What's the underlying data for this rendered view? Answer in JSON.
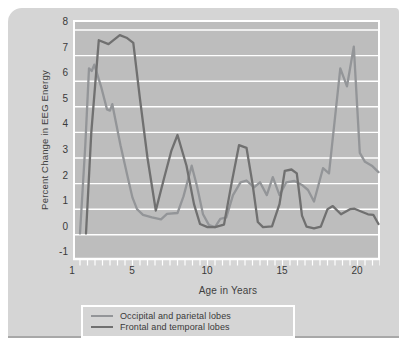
{
  "colors": {
    "page_bg": "#ffffff",
    "figure_bg": "#d5d5d5",
    "plot_bg": "#bdbdbd",
    "grid": "#ffffff",
    "text": "#3a3a3a",
    "series_occipital": "#939598",
    "series_frontal": "#707070"
  },
  "figure": {
    "y_axis_title": "Percent Change in EEG Energy",
    "x_axis_title": "Age in Years",
    "y_ticks": [
      "8",
      "7",
      "6",
      "5",
      "4",
      "3",
      "2",
      "1",
      "0",
      "-1"
    ],
    "x_ticks": [
      "1",
      "5",
      "10",
      "15",
      "20"
    ]
  },
  "legend": {
    "items": [
      {
        "label": "Occipital and parietal lobes"
      },
      {
        "label": "Frontal and temporal lobes"
      }
    ]
  },
  "chart_data": {
    "type": "line",
    "title": "",
    "xlabel": "Age in Years",
    "ylabel": "Percent Change in EEG Energy",
    "xlim": [
      0.53,
      21
    ],
    "ylim": [
      -1,
      8
    ],
    "x_ticks_labeled": [
      1,
      5,
      10,
      15,
      20
    ],
    "x_minor_tick_step": 0.5,
    "grid": "horizontal white lines at each integer",
    "legend_position": "below plot",
    "series": [
      {
        "name": "Occipital and parietal lobes",
        "color": "#939598",
        "points": [
          [
            1.0,
            0.05
          ],
          [
            1.35,
            3.5
          ],
          [
            1.6,
            6.5
          ],
          [
            1.78,
            6.4
          ],
          [
            1.95,
            6.65
          ],
          [
            2.4,
            5.8
          ],
          [
            2.8,
            4.9
          ],
          [
            3.0,
            4.85
          ],
          [
            3.15,
            5.1
          ],
          [
            3.7,
            3.5
          ],
          [
            4.2,
            2.2
          ],
          [
            4.5,
            1.45
          ],
          [
            4.8,
            1.0
          ],
          [
            5.2,
            0.78
          ],
          [
            5.8,
            0.68
          ],
          [
            6.4,
            0.6
          ],
          [
            6.8,
            0.82
          ],
          [
            7.5,
            0.85
          ],
          [
            7.9,
            1.5
          ],
          [
            8.45,
            2.7
          ],
          [
            8.8,
            1.9
          ],
          [
            9.2,
            0.8
          ],
          [
            9.6,
            0.38
          ],
          [
            10.0,
            0.3
          ],
          [
            10.35,
            0.62
          ],
          [
            10.75,
            0.68
          ],
          [
            11.2,
            1.55
          ],
          [
            11.7,
            2.05
          ],
          [
            12.1,
            2.12
          ],
          [
            12.6,
            1.85
          ],
          [
            13.0,
            2.05
          ],
          [
            13.45,
            1.55
          ],
          [
            13.85,
            2.25
          ],
          [
            14.3,
            1.55
          ],
          [
            14.75,
            2.05
          ],
          [
            15.3,
            2.1
          ],
          [
            15.8,
            1.95
          ],
          [
            16.2,
            1.75
          ],
          [
            16.6,
            1.3
          ],
          [
            17.2,
            2.6
          ],
          [
            17.6,
            2.4
          ],
          [
            18.35,
            6.5
          ],
          [
            18.8,
            5.8
          ],
          [
            19.25,
            7.35
          ],
          [
            19.65,
            3.2
          ],
          [
            20.0,
            2.85
          ],
          [
            20.45,
            2.7
          ],
          [
            20.9,
            2.45
          ]
        ]
      },
      {
        "name": "Frontal and temporal lobes",
        "color": "#707070",
        "points": [
          [
            1.4,
            0.05
          ],
          [
            1.75,
            4.0
          ],
          [
            2.25,
            7.6
          ],
          [
            2.9,
            7.45
          ],
          [
            3.65,
            7.8
          ],
          [
            4.1,
            7.7
          ],
          [
            4.55,
            7.5
          ],
          [
            5.0,
            5.3
          ],
          [
            5.5,
            3.0
          ],
          [
            6.05,
            0.95
          ],
          [
            6.6,
            2.2
          ],
          [
            7.1,
            3.3
          ],
          [
            7.5,
            3.9
          ],
          [
            8.1,
            2.7
          ],
          [
            8.6,
            1.2
          ],
          [
            9.0,
            0.42
          ],
          [
            9.5,
            0.3
          ],
          [
            10.0,
            0.3
          ],
          [
            10.6,
            0.4
          ],
          [
            11.1,
            2.0
          ],
          [
            11.6,
            3.5
          ],
          [
            12.1,
            3.4
          ],
          [
            12.5,
            2.0
          ],
          [
            12.85,
            0.5
          ],
          [
            13.2,
            0.3
          ],
          [
            13.8,
            0.33
          ],
          [
            14.3,
            1.2
          ],
          [
            14.65,
            2.5
          ],
          [
            15.1,
            2.55
          ],
          [
            15.45,
            2.4
          ],
          [
            15.8,
            0.75
          ],
          [
            16.1,
            0.32
          ],
          [
            16.6,
            0.25
          ],
          [
            17.05,
            0.32
          ],
          [
            17.5,
            1.0
          ],
          [
            17.85,
            1.12
          ],
          [
            18.4,
            0.8
          ],
          [
            19.0,
            1.0
          ],
          [
            19.3,
            1.02
          ],
          [
            19.7,
            0.92
          ],
          [
            20.2,
            0.8
          ],
          [
            20.55,
            0.78
          ],
          [
            20.9,
            0.42
          ]
        ]
      }
    ]
  }
}
